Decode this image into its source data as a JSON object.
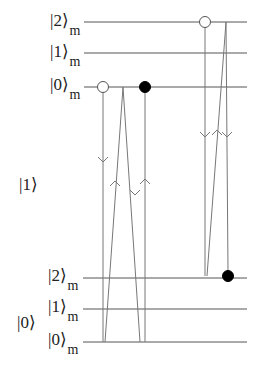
{
  "diagram": {
    "type": "energy-level-transition-diagram",
    "colors": {
      "line": "#555555",
      "text": "#222222",
      "open_circle_fill": "#ffffff",
      "filled_circle": "#000000"
    },
    "groups": [
      {
        "label": "|1⟩",
        "y": 184
      },
      {
        "label": "|0⟩",
        "y": 322
      }
    ],
    "levels": [
      {
        "label": "|2⟩",
        "sub": "m",
        "y": 22
      },
      {
        "label": "|1⟩",
        "sub": "m",
        "y": 53
      },
      {
        "label": "|0⟩",
        "sub": "m",
        "y": 87
      },
      {
        "label": "|2⟩",
        "sub": "m",
        "y": 278
      },
      {
        "label": "|1⟩",
        "sub": "m",
        "y": 309
      },
      {
        "label": "|0⟩",
        "sub": "m",
        "y": 342
      }
    ],
    "markers": [
      {
        "kind": "open",
        "x": 103,
        "y": 87
      },
      {
        "kind": "filled",
        "x": 145,
        "y": 87
      },
      {
        "kind": "open",
        "x": 205,
        "y": 22
      },
      {
        "kind": "filled",
        "x": 228,
        "y": 276
      }
    ],
    "transitions": [
      {
        "x1": 103,
        "y1": 92,
        "x2": 103,
        "y2": 342,
        "arrow": "down",
        "ax": 103,
        "ay": 162
      },
      {
        "x1": 105,
        "y1": 342,
        "x2": 123,
        "y2": 87,
        "arrow": "up",
        "ax": 115,
        "ay": 181
      },
      {
        "x1": 123,
        "y1": 87,
        "x2": 140,
        "y2": 342,
        "arrow": "down",
        "ax": 135,
        "ay": 195
      },
      {
        "x1": 145,
        "y1": 92,
        "x2": 145,
        "y2": 342,
        "arrow": "up",
        "ax": 145,
        "ay": 179
      },
      {
        "x1": 205,
        "y1": 27,
        "x2": 205,
        "y2": 276,
        "arrow": "down",
        "ax": 205,
        "ay": 137
      },
      {
        "x1": 207,
        "y1": 276,
        "x2": 226,
        "y2": 22,
        "arrow": "up",
        "ax": 217,
        "ay": 130
      },
      {
        "x1": 226,
        "y1": 22,
        "x2": 228,
        "y2": 271,
        "arrow": "down",
        "ax": 227,
        "ay": 137
      }
    ]
  }
}
